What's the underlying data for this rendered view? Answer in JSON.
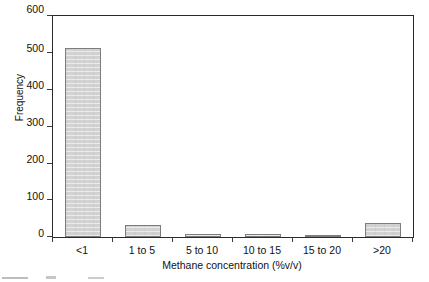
{
  "chart_data": {
    "type": "bar",
    "title": "",
    "subtitle": "",
    "xlabel": "Methane concentration (%v/v)",
    "ylabel": "Frequency",
    "categories": [
      "<1",
      "1 to 5",
      "5 to 10",
      "10 to 15",
      "15 to 20",
      ">20"
    ],
    "values": [
      512,
      33,
      9,
      8,
      5,
      38
    ],
    "ylim": [
      0,
      600
    ],
    "yticks": [
      0,
      100,
      200,
      300,
      400,
      500,
      600
    ],
    "ytick_labels": [
      "0",
      "100",
      "200",
      "300",
      "400",
      "500",
      "600"
    ],
    "grid": false,
    "legend": null,
    "legend_position": "none",
    "bar_fill_color": "#d2d2d2",
    "bar_edge_color": "#7d7d7d",
    "axis_color": "#2b2b2b"
  }
}
